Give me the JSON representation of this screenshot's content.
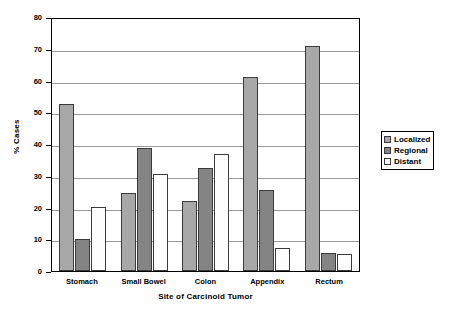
{
  "chart_data": {
    "type": "bar",
    "title": "",
    "xlabel": "Site of Carcinoid Tumor",
    "ylabel": "% Cases",
    "categories": [
      "Stomach",
      "Small Bowel",
      "Colon",
      "Appendix",
      "Rectum"
    ],
    "series": [
      {
        "name": "Localized",
        "color": "#a8a8a8",
        "values": [
          52.5,
          24.5,
          22.0,
          61.0,
          70.8
        ]
      },
      {
        "name": "Regional",
        "color": "#848484",
        "values": [
          10.2,
          38.7,
          32.4,
          25.6,
          5.6
        ]
      },
      {
        "name": "Distant",
        "color": "#fdfdfd",
        "values": [
          20.3,
          30.7,
          36.8,
          7.3,
          5.5
        ]
      }
    ],
    "ylim": [
      0,
      80
    ],
    "yticks": [
      0,
      10,
      20,
      30,
      40,
      50,
      60,
      70,
      80
    ],
    "ytick_labels": [
      "0",
      "10",
      "20",
      "30",
      "40",
      "50",
      "60",
      "70",
      "80"
    ],
    "grid": true,
    "legend_position": "right"
  },
  "legend": {
    "entries": [
      "Localized",
      "Regional",
      "Distant"
    ]
  }
}
